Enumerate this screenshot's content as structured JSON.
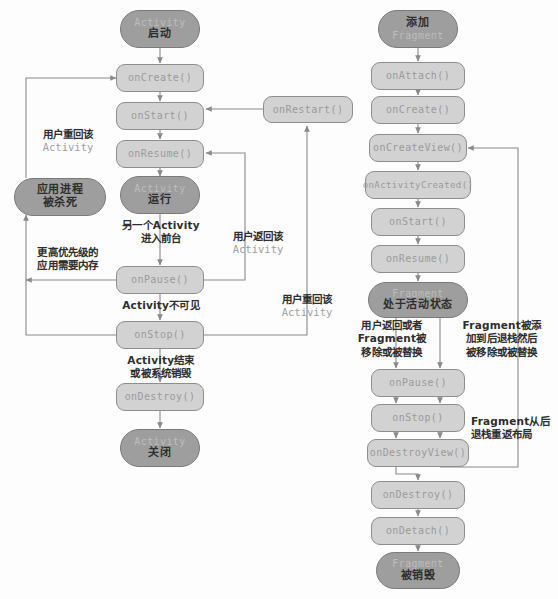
{
  "diagram": {
    "type": "flowchart",
    "colors": {
      "terminal_fill": "#9e9e9e",
      "process_fill": "#d2d2d2",
      "border": "#8e8e8e",
      "edge": "#8a8a8a",
      "cn_text": "#2e2e2e",
      "mono_text": "#9a9a9a",
      "background": "#fdfdfd"
    }
  },
  "activity_column": {
    "heading": "Activity 生命周期",
    "nodes": [
      {
        "id": "act_start",
        "kind": "terminal",
        "mono": "Activity",
        "cn": "启动"
      },
      {
        "id": "act_create",
        "kind": "process",
        "mono": "onCreate()"
      },
      {
        "id": "act_start_m",
        "kind": "process",
        "mono": "onStart()"
      },
      {
        "id": "act_resume",
        "kind": "process",
        "mono": "onResume()"
      },
      {
        "id": "act_running",
        "kind": "terminal",
        "mono": "Activity",
        "cn": "运行"
      },
      {
        "id": "act_pause",
        "kind": "process",
        "mono": "onPause()"
      },
      {
        "id": "act_stop",
        "kind": "process",
        "mono": "onStop()"
      },
      {
        "id": "act_destroy",
        "kind": "process",
        "mono": "onDestroy()"
      },
      {
        "id": "act_closed",
        "kind": "terminal",
        "mono": "Activity",
        "cn": "关闭"
      },
      {
        "id": "act_restart",
        "kind": "process",
        "mono": "onRestart()"
      },
      {
        "id": "act_killed",
        "kind": "terminal",
        "cn_line1": "应用进程",
        "cn_line2": "被杀死"
      }
    ],
    "labels": [
      {
        "id": "lbl_user_return_create",
        "rows": [
          {
            "text": "用户重回该",
            "style": "cn"
          },
          {
            "text": "Activity",
            "style": "mono"
          }
        ]
      },
      {
        "id": "lbl_higher_priority",
        "rows": [
          {
            "text": "更高优先级的",
            "style": "cn"
          },
          {
            "text": "应用需要内存",
            "style": "cn"
          }
        ]
      },
      {
        "id": "lbl_another_activity",
        "rows": [
          {
            "text": "另一个Activity",
            "style": "mixed"
          },
          {
            "text": "进入前台",
            "style": "cn"
          }
        ]
      },
      {
        "id": "lbl_user_back_resume",
        "rows": [
          {
            "text": "用户返回该",
            "style": "cn"
          },
          {
            "text": "Activity",
            "style": "mono"
          }
        ]
      },
      {
        "id": "lbl_activity_invisible",
        "rows": [
          {
            "text": "Activity不可见",
            "style": "mixed"
          }
        ]
      },
      {
        "id": "lbl_activity_finish",
        "rows": [
          {
            "text": "Activity结束",
            "style": "mixed"
          },
          {
            "text": "或被系统销毁",
            "style": "cn"
          }
        ]
      },
      {
        "id": "lbl_user_back_restart",
        "rows": [
          {
            "text": "用户重回该",
            "style": "cn"
          },
          {
            "text": "Activity",
            "style": "mono"
          }
        ]
      }
    ]
  },
  "fragment_column": {
    "heading": "Fragment 生命周期",
    "nodes": [
      {
        "id": "frag_add",
        "kind": "terminal",
        "cn": "添加",
        "mono": "Fragment"
      },
      {
        "id": "frag_attach",
        "kind": "process",
        "mono": "onAttach()"
      },
      {
        "id": "frag_create",
        "kind": "process",
        "mono": "onCreate()"
      },
      {
        "id": "frag_createview",
        "kind": "process",
        "mono": "onCreateView()"
      },
      {
        "id": "frag_actcreated",
        "kind": "process",
        "mono": "onActivityCreated()"
      },
      {
        "id": "frag_start",
        "kind": "process",
        "mono": "onStart()"
      },
      {
        "id": "frag_resume",
        "kind": "process",
        "mono": "onResume()"
      },
      {
        "id": "frag_active",
        "kind": "terminal",
        "mono": "Fragment",
        "cn": "处于活动状态"
      },
      {
        "id": "frag_pause",
        "kind": "process",
        "mono": "onPause()"
      },
      {
        "id": "frag_stop",
        "kind": "process",
        "mono": "onStop()"
      },
      {
        "id": "frag_destroyview",
        "kind": "process",
        "mono": "onDestroyView()"
      },
      {
        "id": "frag_destroy",
        "kind": "process",
        "mono": "onDestroy()"
      },
      {
        "id": "frag_detach",
        "kind": "process",
        "mono": "onDetach()"
      },
      {
        "id": "frag_destroyed",
        "kind": "terminal",
        "mono": "Fragment",
        "cn": "被销毁"
      }
    ],
    "labels": [
      {
        "id": "lbl_user_back_or_removed",
        "rows": [
          {
            "text": "用户返回或者",
            "style": "cn"
          },
          {
            "text": "Fragment被",
            "style": "mixed"
          },
          {
            "text": "移除或被替换",
            "style": "cn"
          }
        ]
      },
      {
        "id": "lbl_added_backstack",
        "rows": [
          {
            "text": "Fragment被添",
            "style": "mixed"
          },
          {
            "text": "加到后退栈然后",
            "style": "cn"
          },
          {
            "text": "被移除或被替换",
            "style": "cn"
          }
        ]
      },
      {
        "id": "lbl_return_from_backstack",
        "rows": [
          {
            "text": "Fragment从后",
            "style": "mixed"
          },
          {
            "text": "退栈重返布局",
            "style": "cn"
          }
        ]
      }
    ]
  }
}
